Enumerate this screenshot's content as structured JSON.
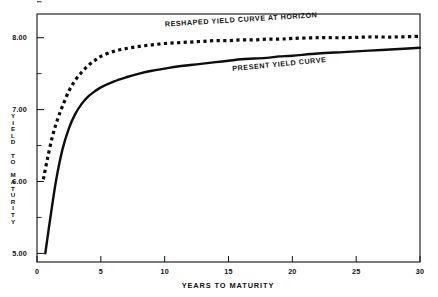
{
  "chart_data": {
    "type": "line",
    "title": "",
    "xlabel": "YEARS TO MATURITY",
    "ylabel": "YIELD TO MATURITY",
    "xlim": [
      0,
      30
    ],
    "ylim": [
      4.88,
      8.33
    ],
    "grid": false,
    "legend_position": "inline-annotations",
    "xticks": [
      0,
      5,
      10,
      15,
      20,
      25,
      30
    ],
    "xtick_labels": [
      "0",
      "5",
      "10",
      "15",
      "20",
      "25",
      "30"
    ],
    "yticks": [
      5.0,
      5.5,
      6.0,
      6.5,
      7.0,
      7.5,
      8.0,
      8.5
    ],
    "ytick_labels": [
      "5.00",
      "",
      "6.00",
      "",
      "7.00",
      "",
      "8.00",
      ""
    ],
    "ytick_major_labels": [
      "5.00",
      "6.00",
      "7.00",
      "8.00"
    ],
    "annotations": [
      {
        "name": "reshaped-curve-label",
        "text": "RESHAPED YIELD CURVE AT HORIZON",
        "x": 16.0,
        "y": 8.22,
        "rotation": -3.5
      },
      {
        "name": "present-curve-label",
        "text": "PRESENT YIELD CURVE",
        "x": 19.0,
        "y": 7.6,
        "rotation": -5.5
      }
    ],
    "series": [
      {
        "name": "PRESENT YIELD CURVE",
        "style": "solid",
        "color": "#0d0d0d",
        "x": [
          0.65,
          1.0,
          1.5,
          2.0,
          2.5,
          3.0,
          3.5,
          4.0,
          4.5,
          5.0,
          6.0,
          7.0,
          8.0,
          9.0,
          10.0,
          11.0,
          12.0,
          13.0,
          14.0,
          15.0,
          16.0,
          17.0,
          18.0,
          19.0,
          20.0,
          22.0,
          24.0,
          26.0,
          28.0,
          30.0
        ],
        "y": [
          5.0,
          5.44,
          6.02,
          6.45,
          6.74,
          6.94,
          7.08,
          7.18,
          7.25,
          7.31,
          7.39,
          7.45,
          7.5,
          7.54,
          7.57,
          7.6,
          7.62,
          7.64,
          7.66,
          7.68,
          7.7,
          7.71,
          7.72,
          7.74,
          7.75,
          7.78,
          7.8,
          7.82,
          7.84,
          7.86
        ]
      },
      {
        "name": "RESHAPED YIELD CURVE AT HORIZON",
        "style": "dotted",
        "color": "#0d0d0d",
        "x": [
          0.5,
          0.8,
          1.2,
          1.6,
          2.0,
          2.5,
          3.0,
          3.5,
          4.0,
          4.5,
          5.0,
          6.0,
          7.0,
          8.0,
          9.0,
          10.0,
          11.0,
          12.0,
          13.0,
          14.0,
          15.0,
          16.0,
          17.0,
          18.0,
          19.0,
          20.0,
          22.0,
          24.0,
          26.0,
          28.0,
          30.0
        ],
        "y": [
          6.03,
          6.3,
          6.62,
          6.86,
          7.05,
          7.26,
          7.41,
          7.52,
          7.61,
          7.68,
          7.74,
          7.81,
          7.85,
          7.88,
          7.9,
          7.92,
          7.93,
          7.94,
          7.95,
          7.96,
          7.96,
          7.97,
          7.97,
          7.98,
          7.98,
          7.99,
          8.0,
          8.0,
          8.01,
          8.01,
          8.02
        ]
      }
    ]
  },
  "axis": {
    "y_label_letters": [
      "Y",
      "I",
      "E",
      "L",
      "D",
      "",
      "T",
      "O",
      "",
      "M",
      "A",
      "T",
      "U",
      "R",
      "I",
      "T",
      "Y"
    ]
  }
}
